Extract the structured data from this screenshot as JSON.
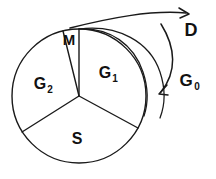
{
  "figure": {
    "type": "sector-disk-diagram",
    "background_color": "#ffffff",
    "stroke_color": "#1a1a1a",
    "labels": {
      "m": "M",
      "g1_base": "G",
      "g1_sub": "1",
      "g2_base": "G",
      "g2_sub": "2",
      "s": "S",
      "d": "D",
      "g0_base": "G",
      "g0_sub": "0"
    },
    "geometry": {
      "circle": {
        "cx": 79,
        "cy": 96,
        "r": 67
      },
      "sectors": [
        {
          "name": "M",
          "label": "M",
          "start_deg": 90,
          "end_deg": 104
        },
        {
          "name": "G1",
          "label": "G",
          "start_deg": 332,
          "end_deg": 90
        },
        {
          "name": "G2",
          "label": "G",
          "start_deg": 104,
          "end_deg": 212
        },
        {
          "name": "S",
          "label": "S",
          "start_deg": 212,
          "end_deg": 332
        }
      ]
    },
    "annotations": [
      {
        "name": "d-arrow",
        "label": "D",
        "description": "arrow sweeping up and to the right from the top of sector M"
      },
      {
        "name": "g0-arrow",
        "label": "G0",
        "description": "curved arrow sweeping clockwise down the right side of the cylinder"
      }
    ]
  }
}
